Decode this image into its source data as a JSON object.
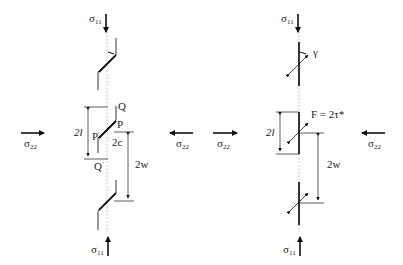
{
  "left_panel": {
    "sigma11_top": "σ",
    "sigma11_top_sub": "11",
    "sigma11_bottom": "σ",
    "sigma11_bottom_sub": "11",
    "sigma22_left": "σ",
    "sigma22_left_sub": "22",
    "sigma22_right": "σ",
    "sigma22_right_sub": "22",
    "label_Q": "Q",
    "label_P": "P",
    "label_P_prime": "P",
    "label_Q_prime": "Q",
    "label_2l": "2l",
    "label_2c": "2c",
    "label_2w": "2w"
  },
  "right_panel": {
    "sigma11_top": "σ",
    "sigma11_top_sub": "11",
    "sigma11_bottom": "σ",
    "sigma11_bottom_sub": "11",
    "sigma22_left": "σ",
    "sigma22_left_sub": "22",
    "sigma22_right": "σ",
    "sigma22_right_sub": "22",
    "label_gamma": "γ",
    "label_force": "F = 2τ*",
    "label_2l": "2l",
    "label_2w": "2w"
  }
}
